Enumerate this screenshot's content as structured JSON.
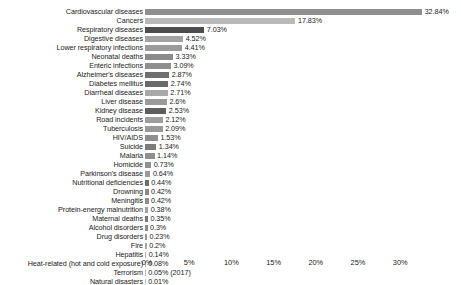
{
  "chart_data": {
    "type": "bar",
    "orientation": "horizontal",
    "title": "",
    "subtitle": "",
    "xlabel": "",
    "ylabel": "",
    "xlim": [
      0,
      34.5
    ],
    "grid": false,
    "legend": null,
    "xticks": [
      "0%",
      "5%",
      "10%",
      "15%",
      "20%",
      "25%",
      "30%"
    ],
    "xtick_values": [
      0,
      5,
      10,
      15,
      20,
      25,
      30
    ],
    "categories": [
      "Cardiovascular diseases",
      "Cancers",
      "Respiratory diseases",
      "Digestive diseases",
      "Lower respiratory infections",
      "Neonatal deaths",
      "Enteric infections",
      "Alzheimer's diseases",
      "Diabetes mellitus",
      "Diarrheal diseases",
      "Liver disease",
      "Kidney disease",
      "Road incidents",
      "Tuberculosis",
      "HIV/AIDS",
      "Suicide",
      "Malaria",
      "Homicide",
      "Parkinson's disease",
      "Nutritional deficiencies",
      "Drowning",
      "Meningitis",
      "Protein-energy malnutrition",
      "Maternal deaths",
      "Alcohol disorders",
      "Drug disorders",
      "Fire",
      "Hepatitis",
      "Heat-related (hot and cold exposure)",
      "Terrorism",
      "Natural disasters"
    ],
    "values": [
      32.84,
      17.83,
      7.03,
      4.52,
      4.41,
      3.33,
      3.09,
      2.87,
      2.74,
      2.71,
      2.6,
      2.53,
      2.12,
      2.09,
      1.53,
      1.34,
      1.14,
      0.73,
      0.64,
      0.44,
      0.42,
      0.42,
      0.38,
      0.35,
      0.3,
      0.23,
      0.2,
      0.14,
      0.08,
      0.05,
      0.01
    ],
    "value_labels": [
      "32.84%",
      "17.83%",
      "7.03%",
      "4.52%",
      "4.41%",
      "3.33%",
      "3.09%",
      "2.87%",
      "2.74%",
      "2.71%",
      "2.6%",
      "2.53%",
      "2.12%",
      "2.09%",
      "1.53%",
      "1.34%",
      "1.14%",
      "0.73%",
      "0.64%",
      "0.44%",
      "0.42%",
      "0.42%",
      "0.38%",
      "0.35%",
      "0.3%",
      "0.23%",
      "0.2%",
      "0.14%",
      "0.08%",
      "0.05% (2017)",
      "0.01%"
    ],
    "bar_colors": [
      "#8f8f8f",
      "#b9b9b9",
      "#4d4d4d",
      "#a3a3a3",
      "#9b9b9b",
      "#8a8a8a",
      "#8f8f8f",
      "#6f6f6f",
      "#6a6a6a",
      "#a8a8a8",
      "#9a9a9a",
      "#5e5e5e",
      "#9e9e9e",
      "#9a9a9a",
      "#8e8e8e",
      "#7c7c7c",
      "#8f8f8f",
      "#909090",
      "#9a9a9a",
      "#6d6d6d",
      "#8a8a8a",
      "#8f8f8f",
      "#a0a0a0",
      "#7a7a7a",
      "#8c8c8c",
      "#9a9a9a",
      "#a5a5a5",
      "#b0b0b0",
      "#b5b5b5",
      "#bdbdbd",
      "#c2c2c2"
    ]
  },
  "layout": {
    "label_column_width_px": 145,
    "axis_origin_x_px": 147,
    "pixels_per_percent": 8.44,
    "row_pitch_px": 9,
    "bar_height_px": 6
  }
}
